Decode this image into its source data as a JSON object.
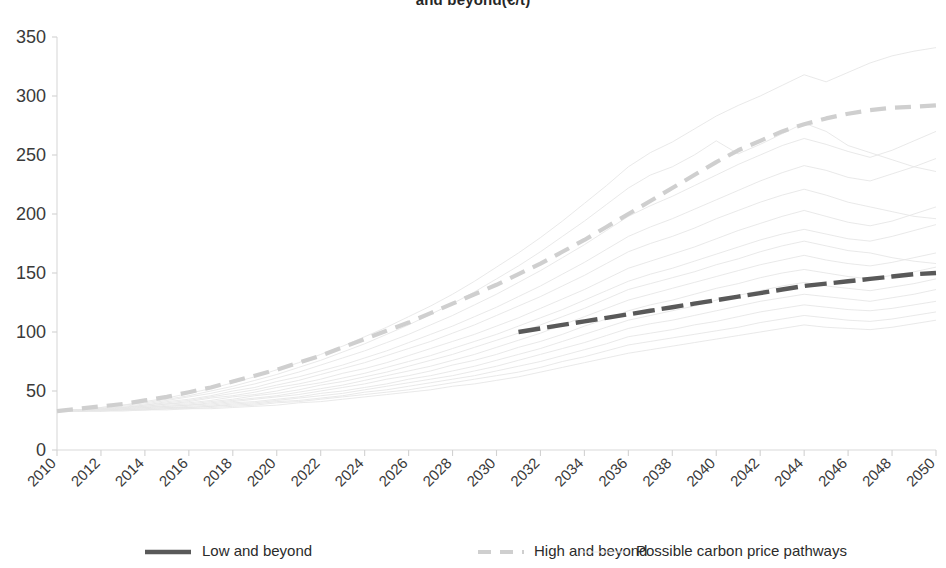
{
  "chart_data": {
    "type": "line",
    "title": "and beyond(€/t)",
    "xlabel": "",
    "ylabel": "",
    "xlim": [
      2010,
      2050
    ],
    "ylim": [
      0,
      350
    ],
    "yticks": [
      0,
      50,
      100,
      150,
      200,
      250,
      300,
      350
    ],
    "xticks": [
      2010,
      2012,
      2014,
      2016,
      2018,
      2020,
      2022,
      2024,
      2026,
      2028,
      2030,
      2032,
      2034,
      2036,
      2038,
      2040,
      2042,
      2044,
      2046,
      2048,
      2050
    ],
    "grid": false,
    "legend_position": "bottom",
    "x": [
      2010,
      2011,
      2012,
      2013,
      2014,
      2015,
      2016,
      2017,
      2018,
      2019,
      2020,
      2021,
      2022,
      2023,
      2024,
      2025,
      2026,
      2027,
      2028,
      2029,
      2030,
      2031,
      2032,
      2033,
      2034,
      2035,
      2036,
      2037,
      2038,
      2039,
      2040,
      2041,
      2042,
      2043,
      2044,
      2045,
      2046,
      2047,
      2048,
      2049,
      2050
    ],
    "series": [
      {
        "name": "Low and beyond",
        "style": "solid-dark",
        "color": "#595959",
        "x_start": 2031,
        "values": [
          null,
          null,
          null,
          null,
          null,
          null,
          null,
          null,
          null,
          null,
          null,
          null,
          null,
          null,
          null,
          null,
          null,
          null,
          null,
          null,
          null,
          100,
          103,
          106,
          109,
          112,
          115,
          118,
          121,
          124,
          127,
          130,
          133,
          136,
          139,
          141,
          143,
          145,
          147,
          149,
          150
        ]
      },
      {
        "name": "High and beyond",
        "style": "dashed-light",
        "color": "#cfcfcf",
        "values": [
          33,
          35,
          37,
          39,
          42,
          45,
          49,
          53,
          58,
          63,
          68,
          74,
          80,
          87,
          94,
          101,
          108,
          116,
          124,
          132,
          140,
          149,
          158,
          168,
          178,
          189,
          200,
          211,
          222,
          233,
          244,
          254,
          262,
          270,
          276,
          281,
          285,
          288,
          290,
          291,
          292
        ]
      },
      {
        "name": "Possible carbon price pathways",
        "style": "thin-faint",
        "color": "#e6e6e6",
        "pathways": [
          [
            33,
            34,
            36,
            38,
            41,
            44,
            48,
            52,
            57,
            62,
            68,
            74,
            81,
            88,
            96,
            104,
            113,
            122,
            132,
            143,
            155,
            167,
            180,
            194,
            209,
            224,
            240,
            252,
            261,
            272,
            283,
            292,
            300,
            309,
            318,
            312,
            320,
            328,
            334,
            338,
            341
          ],
          [
            33,
            34,
            36,
            38,
            40,
            43,
            46,
            50,
            54,
            59,
            64,
            70,
            76,
            83,
            90,
            98,
            106,
            115,
            124,
            134,
            145,
            156,
            168,
            181,
            194,
            208,
            222,
            233,
            240,
            250,
            262,
            251,
            259,
            268,
            277,
            270,
            258,
            252,
            246,
            240,
            236
          ],
          [
            33,
            34,
            35,
            37,
            39,
            42,
            45,
            48,
            52,
            56,
            61,
            66,
            72,
            78,
            84,
            91,
            98,
            106,
            114,
            123,
            132,
            142,
            152,
            163,
            174,
            186,
            198,
            207,
            215,
            224,
            233,
            242,
            250,
            258,
            264,
            259,
            253,
            248,
            254,
            262,
            270
          ],
          [
            33,
            34,
            35,
            36,
            38,
            41,
            43,
            46,
            50,
            53,
            58,
            62,
            67,
            72,
            78,
            84,
            91,
            98,
            105,
            113,
            121,
            130,
            139,
            149,
            159,
            170,
            181,
            189,
            196,
            204,
            212,
            220,
            228,
            235,
            241,
            237,
            231,
            228,
            234,
            240,
            247
          ],
          [
            33,
            34,
            35,
            36,
            38,
            40,
            42,
            45,
            48,
            51,
            55,
            59,
            64,
            69,
            74,
            80,
            86,
            92,
            99,
            106,
            114,
            122,
            130,
            139,
            148,
            158,
            168,
            175,
            181,
            188,
            196,
            203,
            210,
            216,
            221,
            216,
            210,
            206,
            202,
            198,
            196
          ],
          [
            33,
            34,
            35,
            36,
            37,
            39,
            41,
            44,
            46,
            49,
            53,
            56,
            60,
            65,
            69,
            74,
            80,
            86,
            92,
            98,
            105,
            112,
            120,
            128,
            136,
            145,
            154,
            160,
            166,
            172,
            179,
            186,
            192,
            198,
            203,
            198,
            193,
            190,
            194,
            200,
            206
          ],
          [
            33,
            34,
            35,
            36,
            37,
            39,
            40,
            42,
            45,
            47,
            50,
            54,
            57,
            61,
            65,
            70,
            75,
            80,
            86,
            92,
            98,
            105,
            112,
            119,
            127,
            135,
            143,
            149,
            154,
            160,
            166,
            172,
            178,
            183,
            187,
            183,
            179,
            177,
            181,
            186,
            191
          ],
          [
            33,
            34,
            34,
            35,
            36,
            38,
            39,
            41,
            43,
            46,
            48,
            51,
            55,
            58,
            62,
            66,
            71,
            76,
            81,
            87,
            93,
            99,
            106,
            113,
            120,
            128,
            136,
            141,
            146,
            151,
            157,
            162,
            168,
            173,
            177,
            173,
            169,
            167,
            163,
            160,
            158
          ],
          [
            33,
            34,
            34,
            35,
            36,
            37,
            38,
            40,
            42,
            44,
            46,
            49,
            52,
            55,
            59,
            63,
            67,
            71,
            76,
            81,
            87,
            93,
            99,
            106,
            113,
            120,
            127,
            132,
            137,
            142,
            147,
            152,
            157,
            161,
            165,
            161,
            158,
            156,
            159,
            163,
            167
          ],
          [
            33,
            33,
            34,
            35,
            36,
            37,
            38,
            39,
            41,
            43,
            45,
            47,
            50,
            53,
            56,
            60,
            63,
            67,
            72,
            76,
            81,
            87,
            92,
            98,
            105,
            111,
            118,
            123,
            127,
            132,
            137,
            141,
            146,
            150,
            153,
            150,
            147,
            145,
            148,
            151,
            155
          ],
          [
            33,
            33,
            34,
            34,
            35,
            36,
            37,
            38,
            40,
            41,
            43,
            45,
            48,
            50,
            53,
            56,
            60,
            63,
            67,
            71,
            76,
            81,
            86,
            92,
            98,
            104,
            110,
            114,
            118,
            122,
            127,
            131,
            135,
            139,
            142,
            139,
            137,
            135,
            138,
            141,
            145
          ],
          [
            33,
            33,
            34,
            34,
            35,
            36,
            36,
            37,
            39,
            40,
            42,
            44,
            46,
            48,
            51,
            54,
            57,
            60,
            63,
            67,
            71,
            76,
            81,
            86,
            91,
            97,
            103,
            107,
            110,
            114,
            118,
            122,
            126,
            129,
            132,
            130,
            128,
            126,
            129,
            132,
            136
          ],
          [
            33,
            33,
            33,
            34,
            34,
            35,
            36,
            37,
            38,
            39,
            41,
            42,
            44,
            46,
            49,
            51,
            54,
            57,
            60,
            63,
            67,
            71,
            75,
            80,
            85,
            90,
            96,
            99,
            102,
            106,
            109,
            113,
            117,
            120,
            123,
            121,
            119,
            118,
            120,
            123,
            126
          ],
          [
            33,
            33,
            33,
            34,
            34,
            35,
            35,
            36,
            37,
            38,
            40,
            41,
            43,
            45,
            47,
            49,
            51,
            54,
            57,
            60,
            63,
            66,
            70,
            75,
            79,
            84,
            89,
            92,
            95,
            98,
            101,
            104,
            108,
            111,
            114,
            112,
            110,
            109,
            111,
            114,
            117
          ],
          [
            33,
            33,
            33,
            33,
            34,
            34,
            35,
            35,
            36,
            37,
            38,
            40,
            41,
            43,
            45,
            47,
            49,
            51,
            54,
            56,
            59,
            62,
            66,
            70,
            74,
            78,
            82,
            85,
            88,
            91,
            94,
            97,
            100,
            103,
            106,
            104,
            103,
            102,
            104,
            107,
            110
          ]
        ]
      }
    ]
  },
  "legend": {
    "items": [
      {
        "label": "Low and beyond",
        "swatch": "solid-dark"
      },
      {
        "label": "High and beyond",
        "swatch": "dashed-light"
      },
      {
        "label": "Possible carbon price pathways",
        "swatch": "thin-faint"
      }
    ]
  }
}
